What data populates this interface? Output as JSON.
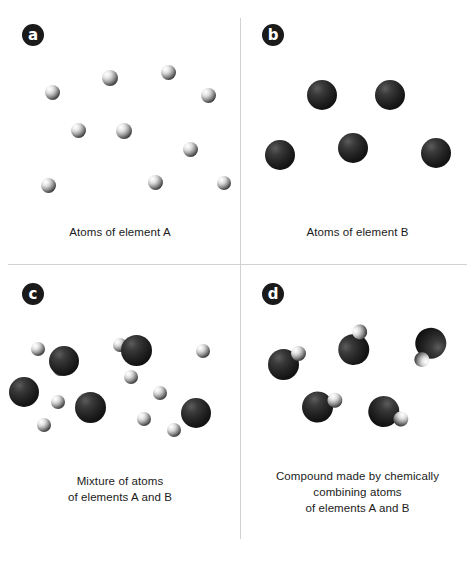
{
  "figure": {
    "background": "#ffffff",
    "divider_color": "#d2d2d2",
    "legend": {
      "element_a_name": "element A",
      "element_a_appearance": "small light-gray sphere",
      "element_b_name": "element B",
      "element_b_appearance": "large dark/black sphere"
    }
  },
  "panels": [
    {
      "id": "a",
      "badge": "a",
      "caption": "Atoms of element A",
      "counts": {
        "element_a": 10,
        "element_b": 0,
        "molecules": 0
      },
      "atoms": [
        {
          "type": "a",
          "cx": 52,
          "cy": 92,
          "d": 15
        },
        {
          "type": "a",
          "cx": 110,
          "cy": 78,
          "d": 16
        },
        {
          "type": "a",
          "cx": 168,
          "cy": 72,
          "d": 15
        },
        {
          "type": "a",
          "cx": 208,
          "cy": 95,
          "d": 15
        },
        {
          "type": "a",
          "cx": 124,
          "cy": 131,
          "d": 16
        },
        {
          "type": "a",
          "cx": 78,
          "cy": 130,
          "d": 15
        },
        {
          "type": "a",
          "cx": 190,
          "cy": 149,
          "d": 15
        },
        {
          "type": "a",
          "cx": 48,
          "cy": 185,
          "d": 15
        },
        {
          "type": "a",
          "cx": 155,
          "cy": 182,
          "d": 15
        },
        {
          "type": "a",
          "cx": 224,
          "cy": 183,
          "d": 14
        }
      ]
    },
    {
      "id": "b",
      "badge": "b",
      "caption": "Atoms of element B",
      "counts": {
        "element_a": 0,
        "element_b": 5,
        "molecules": 0
      },
      "atoms": [
        {
          "type": "b",
          "cx": 40,
          "cy": 155,
          "d": 30
        },
        {
          "type": "b",
          "cx": 82,
          "cy": 95,
          "d": 30
        },
        {
          "type": "b",
          "cx": 113,
          "cy": 148,
          "d": 30
        },
        {
          "type": "b",
          "cx": 150,
          "cy": 95,
          "d": 30
        },
        {
          "type": "b",
          "cx": 196,
          "cy": 153,
          "d": 30
        }
      ]
    },
    {
      "id": "c",
      "badge": "c",
      "caption": "Mixture of atoms\nof elements A and B",
      "caption_lines": [
        "Mixture of atoms",
        "of elements A and B"
      ],
      "counts": {
        "element_a": 11,
        "element_b": 5,
        "molecules": 0
      },
      "atoms": [
        {
          "type": "a",
          "cx": 38,
          "cy": 84,
          "d": 14
        },
        {
          "type": "a",
          "cx": 60,
          "cy": 104,
          "d": 14
        },
        {
          "type": "a",
          "cx": 120,
          "cy": 80,
          "d": 14
        },
        {
          "type": "a",
          "cx": 131,
          "cy": 112,
          "d": 14
        },
        {
          "type": "a",
          "cx": 203,
          "cy": 86,
          "d": 14
        },
        {
          "type": "a",
          "cx": 84,
          "cy": 135,
          "d": 14
        },
        {
          "type": "a",
          "cx": 160,
          "cy": 128,
          "d": 14
        },
        {
          "type": "a",
          "cx": 58,
          "cy": 137,
          "d": 14
        },
        {
          "type": "a",
          "cx": 144,
          "cy": 154,
          "d": 14
        },
        {
          "type": "a",
          "cx": 44,
          "cy": 160,
          "d": 14
        },
        {
          "type": "a",
          "cx": 174,
          "cy": 165,
          "d": 14
        },
        {
          "type": "b",
          "cx": 64,
          "cy": 96,
          "d": 30
        },
        {
          "type": "b",
          "cx": 136,
          "cy": 85,
          "d": 31
        },
        {
          "type": "b",
          "cx": 24,
          "cy": 127,
          "d": 30
        },
        {
          "type": "b",
          "cx": 90,
          "cy": 142,
          "d": 31
        },
        {
          "type": "b",
          "cx": 196,
          "cy": 148,
          "d": 30
        }
      ]
    },
    {
      "id": "d",
      "badge": "d",
      "caption": "Compound made by chemically combining atoms of elements A and B",
      "caption_lines": [
        "Compound made by chemically",
        "combining atoms",
        "of elements A and B"
      ],
      "counts": {
        "element_a": 0,
        "element_b": 0,
        "molecules": 5
      },
      "molecules": [
        {
          "x": 26,
          "y": 78,
          "rotation": 0
        },
        {
          "x": 95,
          "y": 60,
          "rotation": -35
        },
        {
          "x": 163,
          "y": 60,
          "rotation": 155
        },
        {
          "x": 60,
          "y": 122,
          "rotation": 15
        },
        {
          "x": 124,
          "y": 130,
          "rotation": 60
        }
      ]
    }
  ]
}
